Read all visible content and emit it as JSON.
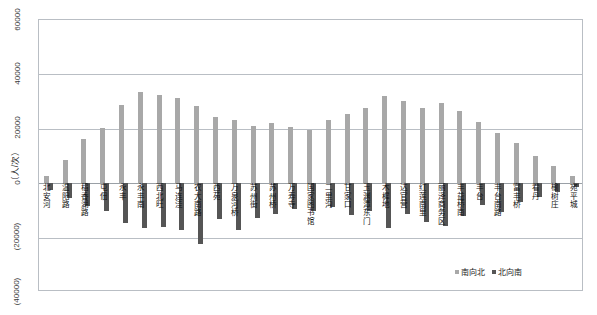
{
  "chart_data": {
    "type": "bar",
    "title": "",
    "subtitle": "",
    "xlabel": "",
    "ylabel": "（人/次）",
    "ylim": [
      -40000,
      60000
    ],
    "yticks": [
      60000,
      40000,
      20000,
      0,
      -20000,
      -40000
    ],
    "ytick_labels": [
      "60000",
      "40000",
      "20000",
      "0",
      "(20000)",
      "(40000)"
    ],
    "grid": true,
    "legend_position": "bottom-right",
    "orientation": "vertical",
    "categories": [
      "北安河",
      "温阳路",
      "稻香湖路",
      "屯佃",
      "永丰",
      "永丰南",
      "西北旺",
      "马连洼",
      "农大南路",
      "西苑",
      "万泉河桥",
      "苏州街",
      "苏州桥",
      "万寿寺",
      "国家图书馆",
      "二里沟",
      "甘家口",
      "玉渊潭东门",
      "木樨地",
      "达官营",
      "红莲南里",
      "丽泽商务区",
      "丰益桥南",
      "丰台",
      "丰台南路",
      "富丰桥",
      "看丹",
      "榆树庄",
      "宛平城"
    ],
    "series": [
      {
        "name": "南向北",
        "color": "#a8a8a8",
        "values": [
          2600,
          8400,
          16200,
          20300,
          28700,
          33500,
          32600,
          31500,
          28300,
          24400,
          23300,
          21100,
          22100,
          20600,
          19600,
          23200,
          25400,
          27800,
          31900,
          30200,
          27500,
          29600,
          26500,
          22500,
          18300,
          14600,
          10100,
          6200,
          2700
        ]
      },
      {
        "name": "北向南",
        "color": "#555555",
        "values": [
          -2600,
          -5300,
          -8500,
          -10200,
          -14600,
          -16500,
          -16100,
          -17200,
          -22500,
          -13200,
          -17300,
          -12800,
          -11300,
          -9600,
          -10400,
          -8800,
          -11600,
          -10200,
          -16300,
          -11400,
          -14300,
          -15800,
          -12200,
          -8200,
          -10600,
          -6800,
          -5200,
          -3300,
          -1500
        ]
      }
    ],
    "legend": [
      {
        "label": "南向北",
        "color": "#a8a8a8"
      },
      {
        "label": "北向南",
        "color": "#555555"
      }
    ]
  }
}
